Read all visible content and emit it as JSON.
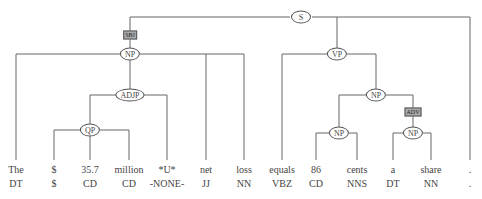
{
  "diagram": {
    "type": "constituency-parse-tree",
    "line_color": "#666666",
    "nodes": [
      {
        "id": "S",
        "label": "S",
        "x": 301,
        "y": 17
      },
      {
        "id": "NP1",
        "label": "NP",
        "x": 130,
        "y": 54
      },
      {
        "id": "VP",
        "label": "VP",
        "x": 337,
        "y": 54
      },
      {
        "id": "ADJP",
        "label": "ADJP",
        "x": 130,
        "y": 95
      },
      {
        "id": "NP2",
        "label": "NP",
        "x": 376,
        "y": 95
      },
      {
        "id": "QP",
        "label": "QP",
        "x": 90,
        "y": 130
      },
      {
        "id": "NP3",
        "label": "NP",
        "x": 339,
        "y": 133
      },
      {
        "id": "NP4",
        "label": "NP",
        "x": 413,
        "y": 133
      }
    ],
    "function_tags": [
      {
        "label": "SBJ",
        "x": 130,
        "y": 35
      },
      {
        "label": "ADV",
        "x": 413,
        "y": 112
      }
    ],
    "tokens": [
      {
        "word": "The",
        "tag": "DT",
        "x": 16
      },
      {
        "word": "$",
        "tag": "$",
        "x": 54
      },
      {
        "word": "35.7",
        "tag": "CD",
        "x": 90
      },
      {
        "word": "million",
        "tag": "CD",
        "x": 129
      },
      {
        "word": "*U*",
        "tag": "-NONE-",
        "x": 167
      },
      {
        "word": "net",
        "tag": "JJ",
        "x": 206
      },
      {
        "word": "loss",
        "tag": "NN",
        "x": 244
      },
      {
        "word": "equals",
        "tag": "VBZ",
        "x": 282
      },
      {
        "word": "86",
        "tag": "CD",
        "x": 316
      },
      {
        "word": "cents",
        "tag": "NNS",
        "x": 357
      },
      {
        "word": "a",
        "tag": "DT",
        "x": 393
      },
      {
        "word": "share",
        "tag": "NN",
        "x": 431
      },
      {
        "word": ".",
        "tag": ".",
        "x": 470
      }
    ]
  }
}
